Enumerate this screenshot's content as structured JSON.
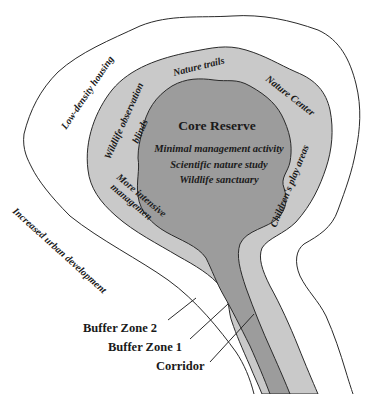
{
  "diagram": {
    "title": "Core Reserve",
    "core_activities": [
      "Minimal management activity",
      "Scientific nature study",
      "Wildlife sanctuary"
    ],
    "buffer_zone_1_labels": {
      "top": "Nature trails",
      "top_right": "Nature Center",
      "right": "Children's play areas",
      "left_upper": "Wildlife observation",
      "left_upper_2": "blinds",
      "left_lower": "More intensive",
      "left_lower_2": "managemen"
    },
    "buffer_zone_2_labels": {
      "upper_left": "Low-density housing"
    },
    "outside_labels": {
      "left": "Increased urban development"
    },
    "legend": [
      {
        "label": "Buffer Zone 2"
      },
      {
        "label": "Buffer Zone 1"
      },
      {
        "label": "Corridor"
      }
    ],
    "colors": {
      "core_fill": "#9c9c9c",
      "buffer1_fill": "#c9c9c9",
      "buffer2_fill": "#ffffff",
      "outline": "#2a2a2a"
    }
  }
}
